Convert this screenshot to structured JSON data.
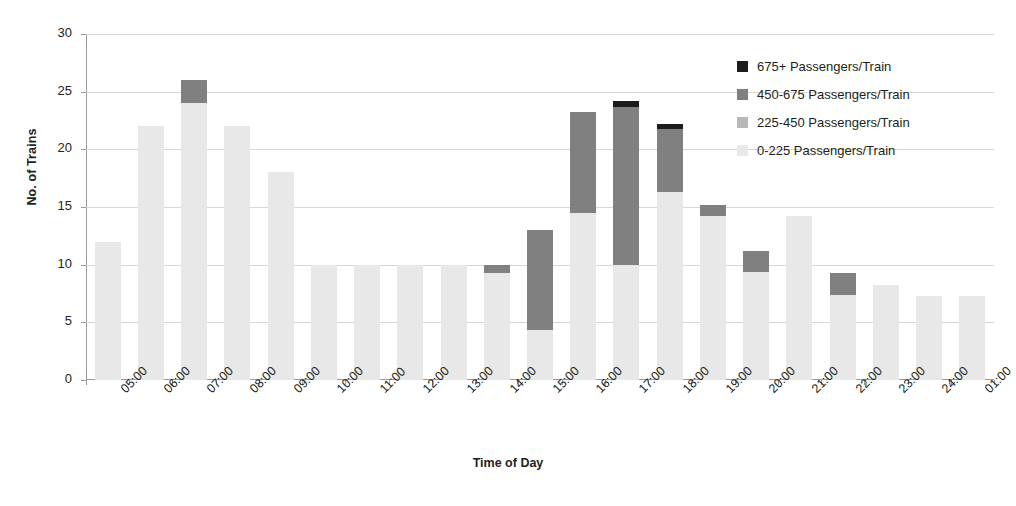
{
  "chart_data": {
    "type": "bar",
    "stacked": true,
    "title": "",
    "xlabel": "Time of Day",
    "ylabel": "No. of Trains",
    "ylim": [
      0,
      30
    ],
    "ytick_step": 5,
    "yticks": [
      "0",
      "5",
      "10",
      "15",
      "20",
      "25",
      "30"
    ],
    "grid": "horizontal",
    "legend_position": "top-right",
    "categories": [
      "05:00",
      "06:00",
      "07:00",
      "08:00",
      "09:00",
      "10:00",
      "11:00",
      "12:00",
      "13:00",
      "14:00",
      "15:00",
      "16:00",
      "17:00",
      "18:00",
      "19:00",
      "20:00",
      "21:00",
      "22:00",
      "23:00",
      "24:00",
      "01:00"
    ],
    "series": [
      {
        "name": "0-225 Passengers/Train",
        "color": "#e8e8e8",
        "values": [
          12,
          22,
          24,
          22,
          18,
          10,
          10,
          10,
          10,
          9.3,
          4.3,
          14.5,
          10,
          16.3,
          14.2,
          9.4,
          14.2,
          7.4,
          8.2,
          7.3,
          7.3
        ]
      },
      {
        "name": "225-450 Passengers/Train",
        "color": "#b8b8b8",
        "values": [
          0,
          0,
          0,
          0,
          0,
          0,
          0,
          0,
          0,
          0,
          0,
          0,
          0,
          0,
          0,
          0,
          0,
          0,
          0,
          0,
          0
        ]
      },
      {
        "name": "450-675 Passengers/Train",
        "color": "#808080",
        "values": [
          0,
          0,
          2,
          0,
          0,
          0,
          0,
          0,
          0,
          0.7,
          8.7,
          8.7,
          13.7,
          5.5,
          1.0,
          1.8,
          0,
          1.9,
          0,
          0,
          0
        ]
      },
      {
        "name": "675+ Passengers/Train",
        "color": "#1c1c1c",
        "values": [
          0,
          0,
          0,
          0,
          0,
          0,
          0,
          0,
          0,
          0,
          0,
          0,
          0.5,
          0.4,
          0,
          0,
          0,
          0,
          0,
          0,
          0
        ]
      }
    ],
    "totals": [
      12,
      22,
      26,
      22,
      18,
      10,
      10,
      10,
      10,
      10,
      13,
      23.2,
      24.2,
      22.2,
      15.2,
      11.2,
      14.2,
      9.3,
      8.2,
      7.3,
      7.3
    ]
  },
  "legend": {
    "entries": [
      {
        "label": "675+ Passengers/Train",
        "color": "#1c1c1c"
      },
      {
        "label": "450-675 Passengers/Train",
        "color": "#808080"
      },
      {
        "label": "225-450 Passengers/Train",
        "color": "#b8b8b8"
      },
      {
        "label": "0-225 Passengers/Train",
        "color": "#e8e8e8"
      }
    ]
  },
  "axes": {
    "y_title": "No. of Trains",
    "x_title": "Time of Day"
  },
  "colors": {
    "axis": "#9a9a9a",
    "grid": "#d6d6d6",
    "text": "#231f20",
    "background": "#ffffff"
  }
}
